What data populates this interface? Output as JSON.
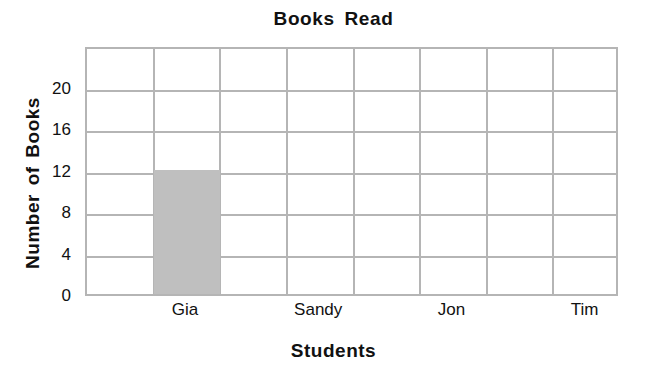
{
  "chart_data": {
    "type": "bar",
    "title": "Books Read",
    "xlabel": "Students",
    "ylabel": "Number of Books",
    "categories": [
      "Gia",
      "Sandy",
      "Jon",
      "Tim"
    ],
    "values": [
      12,
      0,
      0,
      0
    ],
    "series": [
      {
        "name": "Books Read",
        "values": [
          12,
          0,
          0,
          0
        ]
      }
    ],
    "ylim": [
      0,
      24
    ],
    "ytick_labels": [
      "0",
      "4",
      "8",
      "12",
      "16",
      "20"
    ],
    "ytick_values": [
      0,
      4,
      8,
      12,
      16,
      20
    ],
    "grid": true,
    "grid_columns": 8,
    "grid_rows": 6,
    "legend": "none",
    "bar_color": "#bfbfbf",
    "grid_color": "#b5b5b5",
    "text_color": "#111111",
    "background_color": "#ffffff"
  }
}
